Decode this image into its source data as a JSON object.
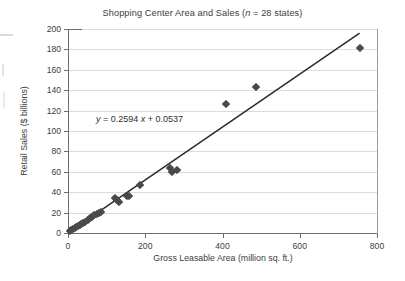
{
  "chart_data": {
    "type": "scatter",
    "title": "Shopping Center Area and Sales (n = 28 states)",
    "title_plain": "Shopping Center Area and Sales (",
    "title_italic": "n",
    "title_tail": " = 28 states)",
    "xlabel": "Gross Leasable Area (million sq. ft.)",
    "ylabel": "Retail Sales ($ billions)",
    "xlim": [
      0,
      800
    ],
    "ylim": [
      0,
      200
    ],
    "xticks": [
      0,
      200,
      400,
      600,
      800
    ],
    "yticks": [
      0,
      20,
      40,
      60,
      80,
      100,
      120,
      140,
      160,
      180,
      200
    ],
    "xtick_labels": [
      "0",
      "200",
      "400",
      "600",
      "800"
    ],
    "ytick_labels": [
      "0",
      "20",
      "40",
      "60",
      "80",
      "100",
      "120",
      "140",
      "160",
      "180",
      "200"
    ],
    "grid": "horizontal",
    "legend": "none",
    "n": 28,
    "marker_shape": "diamond",
    "marker_color": "#4a4a4a",
    "gridline_color": "#dcdcdc",
    "axis_color": "#6e6e6e",
    "trendline": {
      "label": "y = 0.2594 x + 0.0537",
      "equation_prefix": "y",
      "equation_body": " = 0.2594 ",
      "equation_var": "x",
      "equation_tail": " + 0.0537",
      "slope": 0.2594,
      "intercept": 0.0537,
      "color": "#2b2b2b",
      "x_start": 0,
      "x_end": 755
    },
    "points": [
      {
        "x": 5,
        "y": 1.5
      },
      {
        "x": 9,
        "y": 2.5
      },
      {
        "x": 13,
        "y": 3.5
      },
      {
        "x": 17,
        "y": 4.5
      },
      {
        "x": 21,
        "y": 5.5
      },
      {
        "x": 25,
        "y": 6.5
      },
      {
        "x": 30,
        "y": 7.5
      },
      {
        "x": 34,
        "y": 9.0
      },
      {
        "x": 40,
        "y": 9.5
      },
      {
        "x": 45,
        "y": 11.0
      },
      {
        "x": 52,
        "y": 13.0
      },
      {
        "x": 58,
        "y": 15.0
      },
      {
        "x": 63,
        "y": 16.0
      },
      {
        "x": 68,
        "y": 17.5
      },
      {
        "x": 74,
        "y": 19.0
      },
      {
        "x": 80,
        "y": 20.0
      },
      {
        "x": 86,
        "y": 21.0
      },
      {
        "x": 122,
        "y": 34.5
      },
      {
        "x": 128,
        "y": 32.0
      },
      {
        "x": 131,
        "y": 30.5
      },
      {
        "x": 152,
        "y": 36.5
      },
      {
        "x": 158,
        "y": 36.0
      },
      {
        "x": 186,
        "y": 47.5
      },
      {
        "x": 265,
        "y": 64.0
      },
      {
        "x": 268,
        "y": 60.0
      },
      {
        "x": 281,
        "y": 62.0
      },
      {
        "x": 410,
        "y": 126.5
      },
      {
        "x": 488,
        "y": 143.5
      },
      {
        "x": 755,
        "y": 181.0
      }
    ]
  }
}
